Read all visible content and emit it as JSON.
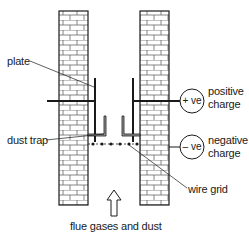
{
  "diagram": {
    "labels": {
      "plate": "plate",
      "dust_trap": "dust trap",
      "wire_grid": "wire grid",
      "flue": "flue gases and dust",
      "positive_line1": "positive",
      "positive_line2": "charge",
      "negative_line1": "negative",
      "negative_line2": "charge"
    },
    "terminals": {
      "positive": "+ ve",
      "negative": "– ve"
    },
    "colors": {
      "line": "#1a1a1a",
      "brick_mortar": "#555555",
      "trap_fill": "#9a9a9a",
      "background": "#ffffff"
    }
  }
}
